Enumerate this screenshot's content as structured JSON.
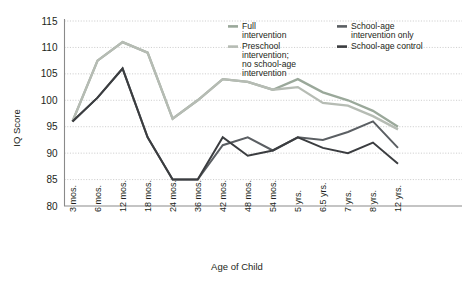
{
  "chart_data": {
    "type": "line",
    "title": "",
    "xlabel": "Age of Child",
    "ylabel": "IQ Score",
    "ylim": [
      80,
      115
    ],
    "yticks": [
      80,
      85,
      90,
      95,
      100,
      105,
      110,
      115
    ],
    "grid": true,
    "legend_position": "top-right",
    "categories": [
      "3 mos.",
      "6 mos.",
      "12 mos.",
      "18 mos.",
      "24 mos.",
      "36 mos.",
      "42 mos.",
      "48 mos.",
      "54 mos.",
      "5 yrs.",
      "6.5 yrs.",
      "7 yrs.",
      "8 yrs.",
      "12 yrs."
    ],
    "series": [
      {
        "name": "Full intervention",
        "color": "#9aa89a",
        "values": [
          96,
          107.5,
          111,
          109,
          96.5,
          100,
          104,
          103.5,
          102,
          104,
          101.5,
          100,
          98,
          95
        ]
      },
      {
        "name": "Preschool intervention; no school-age intervention",
        "color": "#b6bcb4",
        "values": [
          96,
          107.5,
          111,
          109,
          96.5,
          100,
          104,
          103.5,
          102,
          102.5,
          99.5,
          99,
          97,
          94.5
        ]
      },
      {
        "name": "School-age intervention only",
        "color": "#5b5f63",
        "values": [
          96,
          100.5,
          106,
          93,
          85,
          85,
          91.5,
          93,
          90.5,
          93,
          92.5,
          94,
          96,
          91
        ]
      },
      {
        "name": "School-age control",
        "color": "#3b3d40",
        "values": [
          96,
          100.5,
          106,
          93,
          85,
          85,
          93,
          89.5,
          90.5,
          93,
          91,
          90,
          92,
          88
        ]
      }
    ]
  },
  "legend": {
    "items": [
      {
        "label_lines": [
          "Full",
          "intervention"
        ],
        "color": "#9aa89a"
      },
      {
        "label_lines": [
          "Preschool",
          "intervention;",
          "no school-age",
          "intervention"
        ],
        "color": "#b6bcb4"
      },
      {
        "label_lines": [
          "School-age",
          "intervention only"
        ],
        "color": "#5b5f63"
      },
      {
        "label_lines": [
          "School-age control"
        ],
        "color": "#3b3d40"
      }
    ]
  },
  "colors": {
    "grid": "#b9b9b9",
    "axis": "#8a8a8a",
    "text": "#231f20",
    "background": "#ffffff"
  }
}
